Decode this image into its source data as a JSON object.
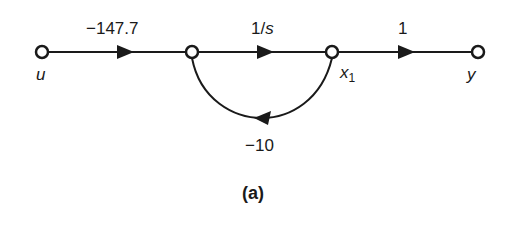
{
  "diagram": {
    "type": "signal-flow-graph",
    "nodes": [
      {
        "id": "u",
        "label": "u"
      },
      {
        "id": "n2",
        "label": ""
      },
      {
        "id": "x1",
        "label": "x",
        "subscript": "1"
      },
      {
        "id": "y",
        "label": "y"
      }
    ],
    "branches": [
      {
        "from": "u",
        "to": "n2",
        "gain": "−147.7"
      },
      {
        "from": "n2",
        "to": "x1",
        "gain_prefix": "1/",
        "gain_var": "s"
      },
      {
        "from": "x1",
        "to": "y",
        "gain": "1"
      },
      {
        "from": "x1",
        "to": "n2",
        "gain": "−10",
        "kind": "feedback"
      }
    ],
    "caption": "(a)",
    "colors": {
      "stroke": "#1a1a1a",
      "background": "#ffffff"
    }
  }
}
